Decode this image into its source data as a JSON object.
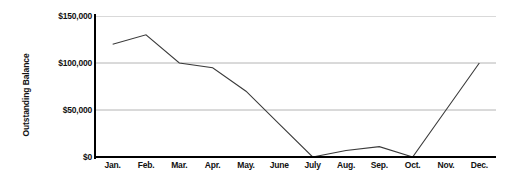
{
  "chart_data": {
    "type": "line",
    "title": "",
    "xlabel": "",
    "ylabel": "Outstanding Balance",
    "categories": [
      "Jan.",
      "Feb.",
      "Mar.",
      "Apr.",
      "May.",
      "June",
      "July",
      "Aug.",
      "Sep.",
      "Oct.",
      "Nov.",
      "Dec."
    ],
    "values": [
      120000,
      130000,
      100000,
      95000,
      70000,
      35000,
      0,
      7000,
      11000,
      0,
      50000,
      100000
    ],
    "series": [
      {
        "name": "Outstanding Balance",
        "values": [
          120000,
          130000,
          100000,
          95000,
          70000,
          35000,
          0,
          7000,
          11000,
          0,
          50000,
          100000
        ]
      }
    ],
    "ylim": [
      0,
      150000
    ],
    "yticks": [
      0,
      50000,
      100000,
      150000
    ],
    "ytick_labels": [
      "$0",
      "$50,000",
      "$100,000",
      "$150,000"
    ],
    "grid": true,
    "legend": "none",
    "line_color": "#3a3a3a",
    "grid_color": "#b4b4b4",
    "axis_color": "#000000",
    "background_color": "#ffffff"
  }
}
